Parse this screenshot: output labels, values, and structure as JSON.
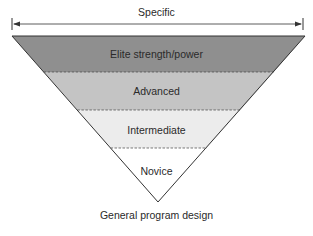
{
  "top_label": "Specific",
  "bottom_label": "General program design",
  "layers": [
    {
      "label": "Elite strength/power",
      "color": "#8f8f8f"
    },
    {
      "label": "Advanced",
      "color": "#c4c4c4"
    },
    {
      "label": "Intermediate",
      "color": "#ececec"
    },
    {
      "label": "Novice",
      "color": "#ffffff"
    }
  ],
  "colors": {
    "outline": "#333333",
    "arrow": "#333333"
  }
}
